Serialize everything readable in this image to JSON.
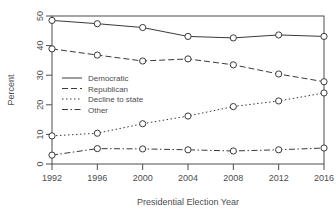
{
  "chart_data": {
    "type": "line",
    "title": "",
    "xlabel": "Presidential Election Year",
    "ylabel": "Percent",
    "categories": [
      1992,
      1996,
      2000,
      2004,
      2008,
      2012,
      2016
    ],
    "x": [
      1992,
      1996,
      2000,
      2004,
      2008,
      2012,
      2016
    ],
    "xticklabels": [
      "1992",
      "1996",
      "2000",
      "2004",
      "2008",
      "2012",
      "2016"
    ],
    "yticks": [
      0,
      10,
      20,
      30,
      40,
      50
    ],
    "yticklabels": [
      "0",
      "10",
      "20",
      "30",
      "40",
      "50"
    ],
    "ylim": [
      0,
      50
    ],
    "xlim": [
      1992,
      2016
    ],
    "grid": false,
    "legend_position": "center-left",
    "marker": "open-circle",
    "series": [
      {
        "name": "Democratic",
        "linestyle": "solid",
        "color": "#3a3a3a",
        "values": [
          48.5,
          47.4,
          46.1,
          43.1,
          42.6,
          43.6,
          43.1
        ]
      },
      {
        "name": "Republican",
        "linestyle": "dashed",
        "color": "#3a3a3a",
        "values": [
          38.9,
          36.8,
          34.8,
          35.5,
          33.5,
          30.4,
          27.8
        ]
      },
      {
        "name": "Decline to state",
        "linestyle": "dotted",
        "color": "#3a3a3a",
        "values": [
          9.5,
          10.4,
          13.6,
          16.2,
          19.4,
          21.3,
          24.0
        ]
      },
      {
        "name": "Other",
        "linestyle": "dashdot",
        "color": "#3a3a3a",
        "values": [
          3.0,
          5.2,
          5.1,
          4.8,
          4.4,
          4.8,
          5.4
        ]
      }
    ]
  },
  "axes": {
    "y_label": "Percent",
    "x_label": "Presidential Election Year"
  },
  "legend": {
    "items": [
      {
        "label": "Democratic"
      },
      {
        "label": "Republican"
      },
      {
        "label": "Decline to state"
      },
      {
        "label": "Other"
      }
    ]
  },
  "ticks": {
    "y": [
      "0",
      "10",
      "20",
      "30",
      "40",
      "50"
    ],
    "x": [
      "1992",
      "1996",
      "2000",
      "2004",
      "2008",
      "2012",
      "2016"
    ]
  },
  "colors": {
    "ink": "#3a3a3a",
    "axis": "#4d4d4d",
    "background": "#ffffff"
  }
}
